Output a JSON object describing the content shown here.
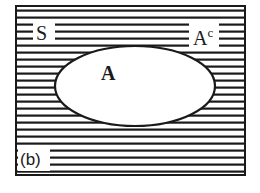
{
  "diagram": {
    "type": "venn",
    "universe": {
      "label": "S",
      "shaded": true
    },
    "set": {
      "label": "A",
      "shaded": false
    },
    "complement": {
      "label": "A",
      "superscript": "c",
      "shaded": true
    },
    "panel_label": "(b)",
    "colors": {
      "ink": "#1a1a1a",
      "background": "#ffffff"
    }
  }
}
